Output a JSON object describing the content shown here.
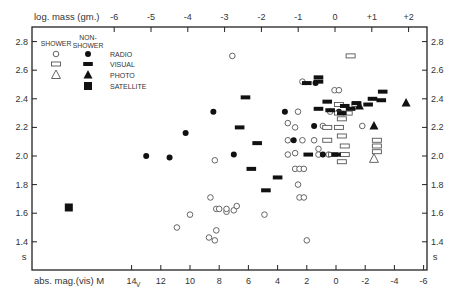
{
  "chart_data": {
    "type": "scatter",
    "title": "",
    "top_axis": {
      "label": "log. mass (gm.)",
      "ticks": [
        "-6",
        "-5",
        "-4",
        "-3",
        "-2",
        "-1",
        "0",
        "+1",
        "+2"
      ],
      "tick_values": [
        -6,
        -5,
        -4,
        -3,
        -2,
        -1,
        0,
        1,
        2
      ]
    },
    "xlabel": "abs. mag.(vis)  M",
    "xlabel_subscript": "V",
    "xticks": [
      14,
      12,
      10,
      8,
      6,
      4,
      2,
      0,
      -2,
      -4,
      -6
    ],
    "xlim": [
      21,
      -6
    ],
    "ylabel": "s",
    "ylabel_right": "s",
    "yticks": [
      2.8,
      2.6,
      2.4,
      2.2,
      2.0,
      1.8,
      1.6,
      1.4
    ],
    "ylim": [
      1.3,
      2.9
    ],
    "grid": false,
    "legend": {
      "position": "upper-left",
      "column_headers": [
        "SHOWER",
        "NON-\nSHOWER"
      ],
      "entries": [
        {
          "label": "RADIO",
          "shower_marker": "open-circle",
          "nonshower_marker": "filled-circle"
        },
        {
          "label": "VISUAL",
          "shower_marker": "open-bar",
          "nonshower_marker": "filled-bar"
        },
        {
          "label": "PHOTO",
          "shower_marker": "open-triangle",
          "nonshower_marker": "filled-triangle"
        },
        {
          "label": "SATELLITE",
          "shower_marker": null,
          "nonshower_marker": "filled-square"
        }
      ]
    },
    "series": [
      {
        "name": "Radio (shower)",
        "marker": "open-circle",
        "points": [
          [
            7.1,
            2.7
          ],
          [
            2.3,
            2.52
          ],
          [
            2.6,
            2.31
          ],
          [
            0.1,
            2.46
          ],
          [
            -0.2,
            2.46
          ],
          [
            8.3,
            1.97
          ],
          [
            10.0,
            1.59
          ],
          [
            10.9,
            1.5
          ],
          [
            8.6,
            1.71
          ],
          [
            8.2,
            1.63
          ],
          [
            8.0,
            1.63
          ],
          [
            8.7,
            1.43
          ],
          [
            8.3,
            1.41
          ],
          [
            8.2,
            1.48
          ],
          [
            7.5,
            1.61
          ],
          [
            7.0,
            1.62
          ],
          [
            6.8,
            1.65
          ],
          [
            7.5,
            1.63
          ],
          [
            4.9,
            1.59
          ],
          [
            3.3,
            2.23
          ],
          [
            3.3,
            2.11
          ],
          [
            3.3,
            2.01
          ],
          [
            2.8,
            2.2
          ],
          [
            2.3,
            2.11
          ],
          [
            2.8,
            1.91
          ],
          [
            2.5,
            1.91
          ],
          [
            2.2,
            1.91
          ],
          [
            2.6,
            1.8
          ],
          [
            2.5,
            1.71
          ],
          [
            2.2,
            1.71
          ],
          [
            2.0,
            1.41
          ],
          [
            1.5,
            2.11
          ],
          [
            1.2,
            2.01
          ],
          [
            0.5,
            2.01
          ],
          [
            2.8,
            2.02
          ],
          [
            0.9,
            2.21
          ],
          [
            0.4,
            2.31
          ],
          [
            -1.8,
            2.21
          ],
          [
            1.2,
            2.05
          ]
        ]
      },
      {
        "name": "Radio (non-shower)",
        "marker": "filled-circle",
        "points": [
          [
            13.0,
            2.0
          ],
          [
            11.4,
            1.99
          ],
          [
            10.3,
            2.16
          ],
          [
            8.4,
            2.31
          ],
          [
            7.0,
            2.01
          ],
          [
            3.5,
            2.31
          ],
          [
            2.9,
            2.11
          ],
          [
            1.5,
            2.21
          ],
          [
            0.9,
            2.01
          ],
          [
            1.4,
            2.51
          ],
          [
            -0.2,
            2.31
          ]
        ]
      },
      {
        "name": "Visual (shower)",
        "marker": "open-bar",
        "points": [
          [
            -1.0,
            2.7
          ],
          [
            -0.2,
            2.36
          ],
          [
            -1.4,
            2.36
          ],
          [
            -0.8,
            2.3
          ],
          [
            -0.2,
            2.3
          ],
          [
            -0.2,
            2.2
          ],
          [
            0.6,
            2.2
          ],
          [
            -0.4,
            2.26
          ],
          [
            -0.4,
            2.14
          ],
          [
            0.6,
            2.11
          ],
          [
            -0.6,
            2.07
          ],
          [
            -0.6,
            2.01
          ],
          [
            0.2,
            2.01
          ],
          [
            -0.4,
            1.96
          ],
          [
            -2.8,
            2.11
          ],
          [
            -2.8,
            2.07
          ],
          [
            -2.8,
            2.03
          ]
        ]
      },
      {
        "name": "Visual (non-shower)",
        "marker": "filled-bar",
        "points": [
          [
            2.0,
            2.51
          ],
          [
            6.2,
            2.41
          ],
          [
            6.6,
            2.2
          ],
          [
            5.4,
            2.09
          ],
          [
            5.8,
            1.91
          ],
          [
            4.8,
            1.76
          ],
          [
            4.0,
            1.85
          ],
          [
            1.2,
            2.55
          ],
          [
            1.2,
            2.52
          ],
          [
            0.6,
            2.38
          ],
          [
            1.2,
            2.33
          ],
          [
            0.4,
            2.32
          ],
          [
            -1.4,
            2.37
          ],
          [
            -2.2,
            2.36
          ],
          [
            -3.1,
            2.39
          ],
          [
            -2.5,
            2.4
          ],
          [
            -3.2,
            2.45
          ],
          [
            -1.0,
            2.33
          ],
          [
            -0.6,
            2.35
          ],
          [
            1.9,
            2.01
          ],
          [
            -0.4,
            2.3
          ],
          [
            0.0,
            2.01
          ]
        ]
      },
      {
        "name": "Photo (shower)",
        "marker": "open-triangle",
        "points": [
          [
            -2.6,
            1.98
          ]
        ]
      },
      {
        "name": "Photo (non-shower)",
        "marker": "filled-triangle",
        "points": [
          [
            -1.6,
            2.35
          ],
          [
            -4.8,
            2.37
          ],
          [
            -2.6,
            2.21
          ]
        ]
      },
      {
        "name": "Satellite (non-shower)",
        "marker": "filled-square",
        "points": [
          [
            18.3,
            1.64
          ]
        ]
      }
    ]
  }
}
